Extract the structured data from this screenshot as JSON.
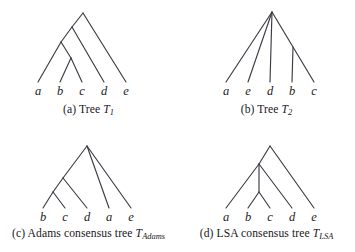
{
  "figure": {
    "background_color": "#ffffff",
    "line_color": "#3b3b44"
  },
  "panels": [
    {
      "id": "a",
      "caption_prefix": "(a) Tree ",
      "caption_symbol": "T",
      "caption_subscript": "1",
      "leaves": [
        {
          "label": "a",
          "x": 38
        },
        {
          "label": "b",
          "x": 60
        },
        {
          "label": "c",
          "x": 82
        },
        {
          "label": "d",
          "x": 104
        },
        {
          "label": "e",
          "x": 126
        }
      ],
      "newick": "(a,((b,c),d),e)"
    },
    {
      "id": "b",
      "caption_prefix": "(b) Tree ",
      "caption_symbol": "T",
      "caption_subscript": "2",
      "leaves": [
        {
          "label": "a",
          "x": 48
        },
        {
          "label": "e",
          "x": 70
        },
        {
          "label": "d",
          "x": 92
        },
        {
          "label": "b",
          "x": 114
        },
        {
          "label": "c",
          "x": 136
        }
      ],
      "newick": "(a,e,d,(b,c))"
    },
    {
      "id": "c",
      "caption_prefix": "(c) Adams consensus tree ",
      "caption_symbol": "T",
      "caption_subscript": "Adams",
      "leaves": [
        {
          "label": "b",
          "x": 43
        },
        {
          "label": "c",
          "x": 65
        },
        {
          "label": "d",
          "x": 87
        },
        {
          "label": "a",
          "x": 109
        },
        {
          "label": "e",
          "x": 131
        }
      ],
      "newick": "(((b,c),d),a,e)"
    },
    {
      "id": "d",
      "caption_prefix": "(d) LSA consensus tree ",
      "caption_symbol": "T",
      "caption_subscript": "LSA",
      "leaves": [
        {
          "label": "a",
          "x": 48
        },
        {
          "label": "b",
          "x": 70
        },
        {
          "label": "c",
          "x": 92
        },
        {
          "label": "d",
          "x": 114
        },
        {
          "label": "e",
          "x": 136
        }
      ],
      "newick": "((a,(b,c),d),e)"
    }
  ]
}
